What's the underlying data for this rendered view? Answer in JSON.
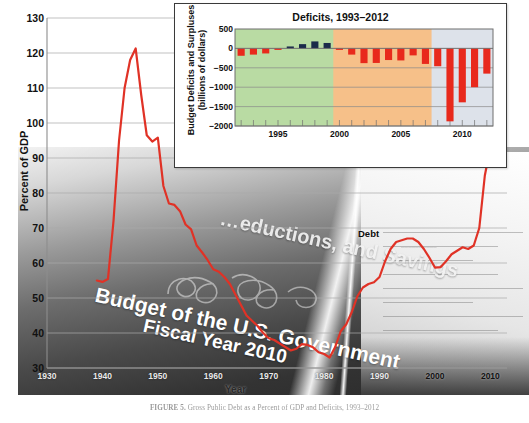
{
  "figure": {
    "caption_label": "FIGURE 5.",
    "caption_text": "Gross Public Debt as a Percent of GDP and Deficits, 1993–2012"
  },
  "background": {
    "watermark_line1": "Budget of the U.S. Government",
    "watermark_line2": "Fiscal Year 2010",
    "watermark_line3": "…eductions, and Savings"
  },
  "main_chart": {
    "ylabel": "Percent of GDP",
    "xlabel": "Year",
    "series_label": "Debt",
    "yticks": [
      130,
      120,
      110,
      100,
      90,
      80,
      70,
      60,
      50,
      40,
      30
    ],
    "xticks": [
      1930,
      1940,
      1950,
      1960,
      1970,
      1980,
      1990,
      2000,
      2010
    ],
    "line_color": "#e03226"
  },
  "inset_chart": {
    "title": "Deficits, 1993–2012",
    "ylabel": "Budget Deficits and Surpluses (billions of dollars)",
    "ylabel_line1": "Budget Deficits and Surpluses",
    "ylabel_line2": "(billions of dollars)",
    "xlabel": "Year",
    "yticks": [
      500,
      0,
      "−500",
      "−1000",
      "−1500",
      "−2000"
    ],
    "xticks": [
      1995,
      2000,
      2005,
      2010
    ],
    "eras": [
      {
        "name": "W. Clinton",
        "start": 1992,
        "end": 2000,
        "color": "#b9dba3"
      },
      {
        "name": "G.W. Bush",
        "start": 2000,
        "end": 2008,
        "color": "#f6c089"
      },
      {
        "name": "B. Obama",
        "start": 2008,
        "end": 2012,
        "color": "#dde2ea"
      }
    ],
    "deficit_color": "#e8291c",
    "surplus_color": "#1b2a4a"
  },
  "chart_data": [
    {
      "type": "line",
      "title": "Gross Public Debt as a Percent of GDP",
      "xlabel": "Year",
      "ylabel": "Percent of GDP",
      "xlim": [
        1930,
        2013
      ],
      "ylim": [
        30,
        130
      ],
      "grid": true,
      "legend": "Debt",
      "series": [
        {
          "name": "Debt",
          "color": "#e03226",
          "x": [
            1939,
            1940,
            1941,
            1942,
            1943,
            1944,
            1945,
            1946,
            1947,
            1948,
            1949,
            1950,
            1951,
            1952,
            1953,
            1954,
            1955,
            1956,
            1957,
            1958,
            1959,
            1960,
            1961,
            1962,
            1963,
            1964,
            1965,
            1966,
            1967,
            1968,
            1969,
            1970,
            1971,
            1972,
            1973,
            1974,
            1975,
            1976,
            1977,
            1978,
            1979,
            1980,
            1981,
            1982,
            1983,
            1984,
            1985,
            1986,
            1987,
            1988,
            1989,
            1990,
            1991,
            1992,
            1993,
            1994,
            1995,
            1996,
            1997,
            1998,
            1999,
            2000,
            2001,
            2002,
            2003,
            2004,
            2005,
            2006,
            2007,
            2008,
            2009,
            2010,
            2011,
            2012
          ],
          "y": [
            55.0,
            54.6,
            55.4,
            72.0,
            95.0,
            110.0,
            118.0,
            121.3,
            108.0,
            96.5,
            94.7,
            95.8,
            82.0,
            77.0,
            76.6,
            74.8,
            71.0,
            69.6,
            65.0,
            63.0,
            60.8,
            58.2,
            57.5,
            56.0,
            54.0,
            51.0,
            48.0,
            45.0,
            43.5,
            42.0,
            40.0,
            38.5,
            38.0,
            37.0,
            36.0,
            35.0,
            35.5,
            36.8,
            36.6,
            35.9,
            34.5,
            34.0,
            33.0,
            36.0,
            40.5,
            42.5,
            46.0,
            50.5,
            53.0,
            54.0,
            54.5,
            56.0,
            60.5,
            64.0,
            66.0,
            66.5,
            67.0,
            67.0,
            66.0,
            64.0,
            61.5,
            58.7,
            58.8,
            60.5,
            62.5,
            63.5,
            64.5,
            64.0,
            65.0,
            70.0,
            85.0,
            93.0,
            97.0,
            98.0
          ]
        }
      ]
    },
    {
      "type": "bar",
      "title": "Deficits, 1993–2012",
      "xlabel": "Year",
      "ylabel": "Budget Deficits and Surpluses (billions of dollars)",
      "xlim": [
        1991.5,
        2012.5
      ],
      "ylim": [
        -2000,
        500
      ],
      "grid": true,
      "categories": [
        1992,
        1993,
        1994,
        1995,
        1996,
        1997,
        1998,
        1999,
        2000,
        2001,
        2002,
        2003,
        2004,
        2005,
        2006,
        2007,
        2008,
        2009,
        2010,
        2011,
        2012
      ],
      "values": [
        -190,
        -160,
        -130,
        -30,
        50,
        110,
        180,
        140,
        -20,
        -160,
        -380,
        -375,
        -300,
        -310,
        -180,
        -400,
        -460,
        -1880,
        -1390,
        -1000,
        -650
      ],
      "bands": [
        {
          "label": "W. Clinton",
          "from": 1992,
          "to": 2000,
          "color": "#b9dba3"
        },
        {
          "label": "G.W. Bush",
          "from": 2000,
          "to": 2008,
          "color": "#f6c089"
        },
        {
          "label": "B. Obama",
          "from": 2008,
          "to": 2012,
          "color": "#dde2ea"
        }
      ]
    }
  ]
}
